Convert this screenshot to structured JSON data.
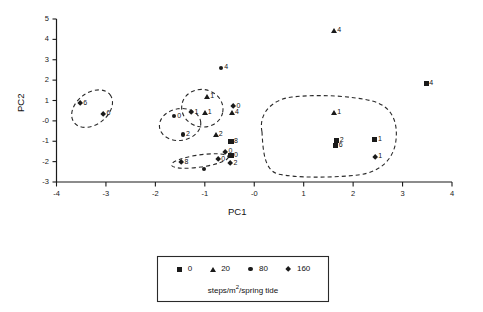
{
  "chart_data": {
    "type": "scatter",
    "title": "",
    "xlabel": "PC1",
    "ylabel": "PC2",
    "xlim": [
      -4,
      4
    ],
    "ylim": [
      -3,
      5
    ],
    "xticks": [
      "-4",
      "-3",
      "-2",
      "-1",
      "-0",
      "1",
      "2",
      "3",
      "4"
    ],
    "xtick_values": [
      -4,
      -3,
      -2,
      -1,
      0,
      1,
      2,
      3,
      4
    ],
    "yticks": [
      "5",
      "4",
      "3",
      "2",
      "1",
      "-0",
      "-1",
      "-2",
      "-3"
    ],
    "ytick_values": [
      5,
      4,
      3,
      2,
      1,
      0,
      -1,
      -2,
      -3
    ],
    "grid": false,
    "legend_position": "bottom",
    "legend_title": "steps/m2/spring tide",
    "series": [
      {
        "name": "0",
        "marker": "square"
      },
      {
        "name": "20",
        "marker": "triangle"
      },
      {
        "name": "80",
        "marker": "circle"
      },
      {
        "name": "160",
        "marker": "diamond"
      }
    ],
    "points": [
      {
        "series": "160",
        "marker": "diamond",
        "label": "6",
        "x": -3.52,
        "y": 0.86,
        "label_side": "left"
      },
      {
        "series": "160",
        "marker": "diamond",
        "label": "6",
        "x": -3.05,
        "y": 0.35,
        "label_side": "left"
      },
      {
        "series": "80",
        "marker": "circle",
        "label": "0",
        "x": -1.62,
        "y": 0.23,
        "label_side": "left"
      },
      {
        "series": "80",
        "marker": "circle",
        "label": "2",
        "x": -1.44,
        "y": -0.66,
        "label_side": "left"
      },
      {
        "series": "160",
        "marker": "diamond",
        "label": "1",
        "x": -1.27,
        "y": 0.42,
        "label_side": "left"
      },
      {
        "series": "20",
        "marker": "triangle",
        "label": "1",
        "x": -1.0,
        "y": 0.4,
        "label_side": "left"
      },
      {
        "series": "20",
        "marker": "triangle",
        "label": "1",
        "x": -0.95,
        "y": 1.18,
        "label_side": "left"
      },
      {
        "series": "160",
        "marker": "diamond",
        "label": "8",
        "x": -1.47,
        "y": -2.03,
        "label_side": "left"
      },
      {
        "series": "160",
        "marker": "diamond",
        "label": "0",
        "x": -0.73,
        "y": -1.88,
        "label_side": "left"
      },
      {
        "series": "80",
        "marker": "circle",
        "label": "4",
        "x": -0.67,
        "y": 2.6,
        "label_side": "left"
      },
      {
        "series": "160",
        "marker": "diamond",
        "label": "0",
        "x": -0.42,
        "y": 0.72,
        "label_side": "left"
      },
      {
        "series": "20",
        "marker": "triangle",
        "label": "4",
        "x": -0.45,
        "y": 0.41,
        "label_side": "left"
      },
      {
        "series": "20",
        "marker": "triangle",
        "label": "2",
        "x": -0.78,
        "y": -0.66,
        "label_side": "left"
      },
      {
        "series": "0",
        "marker": "square",
        "label": "8",
        "x": -0.47,
        "y": -1.02,
        "label_side": "left"
      },
      {
        "series": "160",
        "marker": "diamond",
        "label": "0",
        "x": -0.58,
        "y": -1.52,
        "label_side": "left"
      },
      {
        "series": "0",
        "marker": "square",
        "label": "0",
        "x": -0.47,
        "y": -1.7,
        "label_side": "left"
      },
      {
        "series": "160",
        "marker": "diamond",
        "label": "2",
        "x": -0.48,
        "y": -2.1,
        "label_side": "left"
      },
      {
        "series": "80",
        "marker": "circle",
        "label": "",
        "x": -1.02,
        "y": -2.36,
        "label_side": "left"
      },
      {
        "series": "20",
        "marker": "triangle",
        "label": "1",
        "x": 1.62,
        "y": 0.4,
        "label_side": "left"
      },
      {
        "series": "0",
        "marker": "square",
        "label": "2",
        "x": 1.67,
        "y": -0.97,
        "label_side": "left"
      },
      {
        "series": "0",
        "marker": "square",
        "label": "6",
        "x": 1.65,
        "y": -1.22,
        "label_side": "left"
      },
      {
        "series": "0",
        "marker": "square",
        "label": "1",
        "x": 2.44,
        "y": -0.9,
        "label_side": "left"
      },
      {
        "series": "160",
        "marker": "diamond",
        "label": "1",
        "x": 2.45,
        "y": -1.77,
        "label_side": "left"
      },
      {
        "series": "20",
        "marker": "triangle",
        "label": "4",
        "x": 1.62,
        "y": 4.42,
        "label_side": "left"
      },
      {
        "series": "0",
        "marker": "square",
        "label": "4",
        "x": 3.48,
        "y": 1.82,
        "label_side": "left"
      }
    ],
    "hulls": [
      {
        "name": "cluster-left-160",
        "cx": -3.28,
        "cy": 0.6,
        "rx": 0.46,
        "ry": 0.78,
        "rotate": -38
      },
      {
        "name": "cluster-mid-left",
        "cx": -1.5,
        "cy": -0.18,
        "rx": 0.42,
        "ry": 0.78,
        "rotate": -8
      },
      {
        "name": "cluster-mid-right",
        "cx": -1.05,
        "cy": 0.62,
        "rx": 0.42,
        "ry": 0.92,
        "rotate": 12
      },
      {
        "name": "cluster-bottom",
        "cx": -1.1,
        "cy": -1.97,
        "rx": 0.58,
        "ry": 0.3,
        "rotate": -8
      }
    ],
    "big_hull_path": "M 262 132 C 258 112, 274 99, 292 97 C 320 94, 352 96, 372 101 C 392 106, 398 122, 396 140 C 394 158, 382 172, 358 175 C 330 178, 296 178, 278 174 C 264 170, 263 150, 262 132 Z"
  },
  "legend": {
    "caption_prefix": "steps/m",
    "caption_sup": "2",
    "caption_suffix": "/spring tide",
    "entries": [
      {
        "label": "0",
        "marker": "square"
      },
      {
        "label": "20",
        "marker": "triangle"
      },
      {
        "label": "80",
        "marker": "circle"
      },
      {
        "label": "160",
        "marker": "diamond"
      }
    ]
  }
}
